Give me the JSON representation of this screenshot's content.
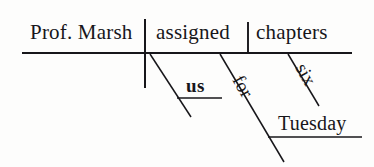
{
  "diagram": {
    "type": "reed-kellogg-sentence-diagram",
    "sentence": "Prof. Marsh assigned us six chapters for Tuesday.",
    "ink_color": "#17161a",
    "background_color": "#fdfdfc",
    "labels": {
      "subject": "Prof. Marsh",
      "verb": "assigned",
      "direct_object": "chapters",
      "indirect_object": "us",
      "preposition": "for",
      "modifier": "six",
      "prep_object": "Tuesday"
    },
    "lines": {
      "baseline": {
        "x1": 22,
        "y1": 53,
        "x2": 352,
        "y2": 53
      },
      "subject_verb_divider": {
        "x1": 145,
        "y1": 19,
        "x2": 145,
        "y2": 88
      },
      "verb_object_divider": {
        "x1": 248,
        "y1": 22,
        "x2": 248,
        "y2": 53
      },
      "indirect_object_slant": {
        "x1": 150,
        "y1": 54,
        "x2": 191,
        "y2": 117
      },
      "indirect_object_line": {
        "x1": 177,
        "y1": 98,
        "x2": 222,
        "y2": 98
      },
      "preposition_slant": {
        "x1": 220,
        "y1": 54,
        "x2": 284,
        "y2": 162
      },
      "prep_object_line": {
        "x1": 268,
        "y1": 137,
        "x2": 362,
        "y2": 137
      },
      "modifier_slant": {
        "x1": 288,
        "y1": 54,
        "x2": 319,
        "y2": 106
      }
    }
  }
}
